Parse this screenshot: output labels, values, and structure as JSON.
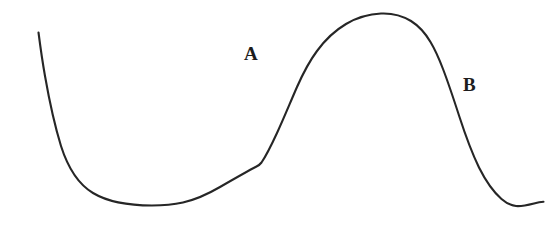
{
  "figure": {
    "background_color": "#ffffff",
    "width": 558,
    "height": 226,
    "curve": {
      "name": "hand-drawn-sigmoid-curve",
      "stroke_color": "#262626",
      "stroke_width": 2.1,
      "path": "M 38.5 32.5 C 40.5 48 42.5 62 45 76 C 48.5 96 53 120 61 146 C 68 168 78 184 93 193 C 108 202 130 205.5 152 205.5 C 163 205.5 174 204.5 183 202.5 C 196 199.5 208 194 220 187 C 233 179.5 246 172 256.5 166.5 C 258.5 165.5 260 164.5 261.5 162.5 C 266 156 271 146 277 133 C 283.5 119 290 103 297 87 C 303 73.5 309.5 61 317 51 C 325 40 335 30.5 346 24 C 357 17.5 369 14 381 13.5 C 392 13 402 15.5 411 21 C 419 26 425.5 33.5 430.5 42 C 435 49.5 439 58.5 443 69 C 448 82 453.5 98.5 459.5 117 C 465.5 135.5 472 153 479 167.5 C 486 181.5 493.5 192 501.5 199 C 506 203 511 205.5 516 206 C 521.5 206.5 528 205 534 203.5 C 538 202.5 541 202 543.5 201.8"
    },
    "labels": [
      {
        "id": "A",
        "text": "A",
        "x": 244,
        "y": 44,
        "color": "#1d1d1d"
      },
      {
        "id": "B",
        "text": "B",
        "x": 463,
        "y": 75,
        "color": "#1d1d1d"
      }
    ]
  },
  "chart_data": {
    "type": "line",
    "title": "",
    "subtitle": "",
    "xlabel": "",
    "ylabel": "",
    "grid": false,
    "legend": "none",
    "axis_visible": false,
    "tick_labels": [],
    "xlim": [
      0,
      558
    ],
    "ylim": [
      226,
      0
    ],
    "annotations": [
      {
        "label": "A",
        "x": 244,
        "y": 44
      },
      {
        "label": "B",
        "x": 463,
        "y": 75
      }
    ],
    "series": [
      {
        "name": "curve",
        "color": "#262626",
        "x": [
          38,
          45,
          61,
          93,
          127,
          152,
          183,
          210,
          240,
          258,
          262,
          277,
          297,
          317,
          346,
          381,
          411,
          430,
          443,
          459,
          479,
          501,
          516,
          534,
          543
        ],
        "y": [
          33,
          76,
          146,
          193,
          203,
          206,
          203,
          192,
          176,
          166,
          163,
          133,
          87,
          51,
          24,
          14,
          21,
          42,
          69,
          117,
          168,
          199,
          206,
          204,
          202
        ]
      }
    ]
  }
}
